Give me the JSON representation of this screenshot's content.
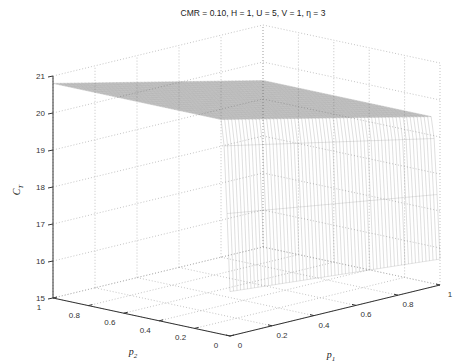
{
  "chart_data": {
    "type": "surface",
    "title": "CMR = 0.10,  H = 1,   U = 5,  V = 1,  η = 3",
    "xlabel": "p1",
    "ylabel": "p2",
    "zlabel": "C_T",
    "xlabel_display": {
      "base": "p",
      "sub": "1"
    },
    "ylabel_display": {
      "base": "p",
      "sub": "2"
    },
    "zlabel_display": {
      "base": "C",
      "sub": "T"
    },
    "xlim": [
      0,
      1
    ],
    "ylim": [
      0,
      1
    ],
    "zlim": [
      15,
      21
    ],
    "xticks": [
      "0",
      "0.2",
      "0.4",
      "0.6",
      "0.8",
      "1"
    ],
    "yticks": [
      "0",
      "0.2",
      "0.4",
      "0.6",
      "0.8",
      "1"
    ],
    "zticks": [
      "15",
      "16",
      "17",
      "18",
      "19",
      "20",
      "21"
    ],
    "grid": true,
    "corner_values": {
      "p1_0_p2_1": 20.8,
      "p1_1_p2_1": 19.5,
      "p1_1_p2_near0": 19.3,
      "p1_1_p2_0": 15.7,
      "p1_0_p2_0": 16.2
    },
    "surface_rendering": "mesh (grayscale wireframe)"
  }
}
